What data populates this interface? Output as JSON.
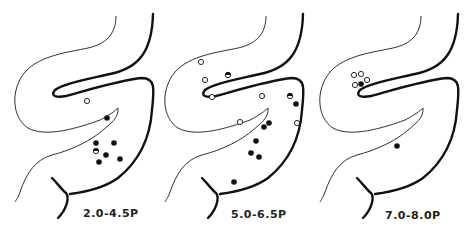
{
  "panels": [
    {
      "label": "2.0-4.5P",
      "offset_x": 0,
      "open_points": [
        [
          87,
          101
        ]
      ],
      "filled_points": [
        [
          107,
          118
        ],
        [
          96,
          143
        ],
        [
          114,
          143
        ],
        [
          106,
          155
        ],
        [
          99,
          162
        ],
        [
          120,
          159
        ]
      ],
      "half_points": [
        [
          96,
          151
        ]
      ]
    },
    {
      "label": "5.0-6.5P",
      "offset_x": 150,
      "open_points": [
        [
          201,
          62
        ],
        [
          205,
          80
        ],
        [
          212,
          97
        ],
        [
          262,
          96
        ],
        [
          240,
          122
        ],
        [
          297,
          123
        ]
      ],
      "filled_points": [
        [
          296,
          104
        ],
        [
          269,
          123
        ],
        [
          264,
          127
        ],
        [
          256,
          141
        ],
        [
          251,
          153
        ],
        [
          259,
          157
        ],
        [
          234,
          182
        ]
      ],
      "half_points": [
        [
          228,
          75
        ],
        [
          290,
          96
        ]
      ]
    },
    {
      "label": "7.0-8.0P",
      "offset_x": 305,
      "open_points": [
        [
          354,
          75
        ],
        [
          361,
          74
        ],
        [
          367,
          80
        ],
        [
          355,
          85
        ]
      ],
      "filled_points": [
        [
          361,
          84
        ],
        [
          397,
          146
        ]
      ],
      "half_points": []
    }
  ],
  "colors": {
    "stroke": "#111111",
    "background": "#ffffff"
  }
}
